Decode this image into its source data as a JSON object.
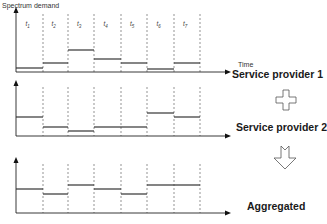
{
  "chart_data": {
    "type": "diagram",
    "y_axis_label": "Spectrum demand",
    "x_axis_label": "Time",
    "time_slots": [
      "t1",
      "t2",
      "t3",
      "t4",
      "t5",
      "t6",
      "t7"
    ],
    "slot_boundaries_px": [
      16,
      43,
      68,
      94,
      121,
      147,
      174,
      200
    ],
    "panels": [
      {
        "name": "Service provider 1",
        "axis_y": 72,
        "axis_top": 10,
        "levels_px": [
          68,
          63,
          50,
          59,
          63,
          69,
          63
        ]
      },
      {
        "name": "Service provider 2",
        "axis_y": 136,
        "axis_top": 83,
        "levels_px": [
          117,
          127,
          131,
          127,
          127,
          113,
          117
        ]
      },
      {
        "name": "Aggregated",
        "axis_y": 213,
        "axis_top": 160,
        "levels_px": [
          189,
          194,
          185,
          189,
          194,
          185,
          185
        ]
      }
    ]
  },
  "labels": {
    "y_axis": "Spectrum demand",
    "x_axis": "Time",
    "provider1": "Service provider 1",
    "provider2": "Service provider 2",
    "aggregated": "Aggregated"
  },
  "slots": [
    "t1",
    "t2",
    "t3",
    "t4",
    "t5",
    "t6",
    "t7"
  ],
  "symbols": {
    "plus": "plus-icon",
    "arrow": "down-arrow-icon"
  }
}
